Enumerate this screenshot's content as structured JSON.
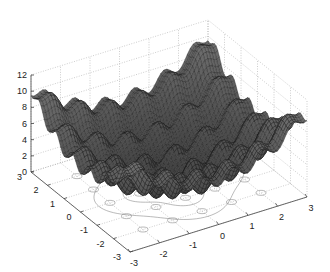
{
  "chart_data": {
    "type": "surface_mesh_with_contour",
    "title": "",
    "xlabel": "",
    "ylabel": "",
    "zlabel": "",
    "x_ticks": [
      "-3",
      "-2",
      "-1",
      "0",
      "1",
      "2",
      "3"
    ],
    "y_ticks": [
      "-3",
      "-2",
      "-1",
      "0",
      "1",
      "2",
      "3"
    ],
    "z_ticks": [
      "0",
      "2",
      "4",
      "6",
      "8",
      "10",
      "12"
    ],
    "xlim": [
      -3,
      3
    ],
    "ylim": [
      -3,
      3
    ],
    "zlim": [
      0,
      12
    ],
    "grid": true,
    "surface": {
      "description": "Multimodal surface with global minimum 0 at origin, rising toward edges (~10 at corners) with periodic ripples (local minima at integer grid points)",
      "min": {
        "x": 0,
        "y": 0,
        "z": 0
      },
      "max_approx": 10.5,
      "colormap": "grayscale mesh (dark)"
    },
    "contour": {
      "plane_z": 0,
      "description": "Contour lines projected on base plane, showing small closed loops at integer (x,y) local minima and wavy level curves"
    }
  }
}
